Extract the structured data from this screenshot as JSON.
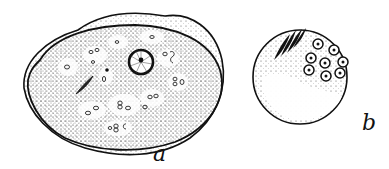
{
  "figure": {
    "panels": [
      {
        "id": "a",
        "label": "a",
        "subject": "large oval cell with stippled cytoplasm, central nucleus and vacuoles"
      },
      {
        "id": "b",
        "label": "b",
        "subject": "round cell with spindle-shaped bodies and cluster of small nucleated cells"
      }
    ],
    "colors": {
      "ink": "#111111",
      "paper": "#ffffff"
    }
  }
}
